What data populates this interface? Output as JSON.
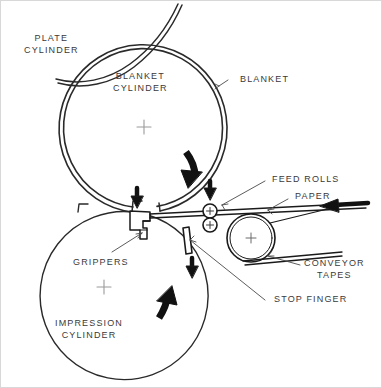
{
  "figure": {
    "background_color": "#ffffff",
    "line_color": "#1a1a1a",
    "text_color": "#3a3a3a",
    "center_mark_color": "#9a9a9a"
  },
  "labels": {
    "plate_cylinder": {
      "line1": "PLATE",
      "line2": "CYLINDER"
    },
    "blanket_cylinder": {
      "line1": "BLANKET",
      "line2": "CYLINDER"
    },
    "blanket": {
      "line1": "BLANKET"
    },
    "feed_rolls": {
      "line1": "FEED ROLLS"
    },
    "paper": {
      "line1": "PAPER"
    },
    "conveyor_tapes": {
      "line1": "CONVEYOR",
      "line2": "TAPES"
    },
    "stop_finger": {
      "line1": "STOP FINGER"
    },
    "grippers": {
      "line1": "GRIPPERS"
    },
    "impression_cylinder": {
      "line1": "IMPRESSION",
      "line2": "CYLINDER"
    }
  },
  "components": {
    "plate_cylinder": {
      "name": "plate-cylinder",
      "shape": "partial-arc",
      "center_x": 120,
      "center_y": -55,
      "radius": 95
    },
    "blanket_cylinder": {
      "name": "blanket-cylinder",
      "shape": "circle",
      "center_x": 144,
      "center_y": 127,
      "radius": 84,
      "has_center_mark": true,
      "rotation": "clockwise"
    },
    "impression_cylinder": {
      "name": "impression-cylinder",
      "shape": "circle",
      "center_x": 104,
      "center_y": 287,
      "radius": 84,
      "has_center_mark": true,
      "rotation": "counter-clockwise"
    },
    "feed_roll_upper": {
      "name": "feed-roll-upper",
      "center_x": 210,
      "center_y": 211,
      "radius": 7,
      "has_center_mark": true
    },
    "feed_roll_lower": {
      "name": "feed-roll-lower",
      "center_x": 210,
      "center_y": 225,
      "radius": 7,
      "has_center_mark": true
    },
    "conveyor_roller": {
      "name": "conveyor-roller",
      "center_x": 251,
      "center_y": 238,
      "radius": 24,
      "has_center_mark": true
    },
    "grippers": {
      "name": "grippers",
      "shape": "hook-bracket"
    },
    "stop_finger": {
      "name": "stop-finger",
      "shape": "narrow-rectangle"
    },
    "paper_sheet": {
      "name": "paper-sheet",
      "shape": "thin-strip"
    },
    "conveyor_tapes": {
      "name": "conveyor-tapes",
      "shape": "thin-strip-pair"
    }
  },
  "arrows": {
    "blanket_rotation": {
      "name": "blanket-rotation-arrow",
      "direction": "clockwise-curved"
    },
    "impression_rotation": {
      "name": "impression-rotation-arrow",
      "direction": "counter-clockwise-curved"
    },
    "nip_down_left": {
      "name": "nip-down-arrow-left",
      "direction": "down"
    },
    "nip_down_right": {
      "name": "nip-down-arrow-right",
      "direction": "down"
    },
    "stop_finger_down": {
      "name": "stop-finger-down-arrow",
      "direction": "down"
    },
    "paper_feed": {
      "name": "paper-feed-arrow",
      "direction": "left"
    }
  }
}
